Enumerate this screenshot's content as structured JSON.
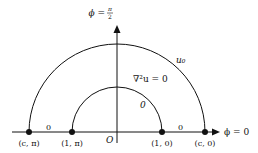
{
  "diagram": {
    "axes": {
      "vertical_label": "ϕ = π/2",
      "vertical_label_lhs": "ϕ =",
      "vertical_label_num": "π",
      "vertical_label_den": "2",
      "horizontal_label": "ϕ = 0",
      "origin_label": "O"
    },
    "arcs": {
      "outer_label": "u₀",
      "inner_label": "0"
    },
    "region_equation": "∇²u = 0",
    "boundary_labels": {
      "left_segment": "0",
      "right_segment": "0"
    },
    "points": [
      {
        "label": "(c, π)"
      },
      {
        "label": "(1, π)"
      },
      {
        "label": "(1, 0)"
      },
      {
        "label": "(c, 0)"
      }
    ],
    "colors": {
      "stroke": "#111111",
      "background": "#ffffff"
    }
  }
}
